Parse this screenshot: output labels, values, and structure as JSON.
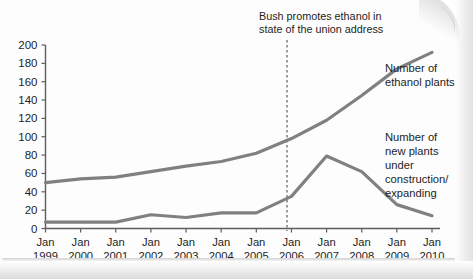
{
  "chart_data": {
    "type": "line",
    "title": "",
    "subtitle": "",
    "xlabel": "",
    "ylabel": "",
    "grid": false,
    "legend_position": "inline-right",
    "x": [
      "Jan 1999",
      "Jan 2000",
      "Jan 2001",
      "Jan 2002",
      "Jan 2003",
      "Jan 2004",
      "Jan 2005",
      "Jan 2006",
      "Jan 2007",
      "Jan 2008",
      "Jan 2009",
      "Jan 2010"
    ],
    "xtick_lines": [
      [
        "Jan",
        "1999"
      ],
      [
        "Jan",
        "2000"
      ],
      [
        "Jan",
        "2001"
      ],
      [
        "Jan",
        "2002"
      ],
      [
        "Jan",
        "2003"
      ],
      [
        "Jan",
        "2004"
      ],
      [
        "Jan",
        "2005"
      ],
      [
        "Jan",
        "2006"
      ],
      [
        "Jan",
        "2007"
      ],
      [
        "Jan",
        "2008"
      ],
      [
        "Jan",
        "2009"
      ],
      [
        "Jan",
        "2010"
      ]
    ],
    "ylim": [
      0,
      200
    ],
    "yticks": [
      0,
      20,
      40,
      60,
      80,
      100,
      120,
      140,
      160,
      180,
      200
    ],
    "series": [
      {
        "name": "Number of ethanol plants",
        "label_lines": [
          "Number of",
          "ethanol plants"
        ],
        "color": "#808080",
        "values": [
          50,
          54,
          56,
          62,
          68,
          73,
          82,
          98,
          118,
          145,
          174,
          192
        ]
      },
      {
        "name": "Number of new plants under construction/expanding",
        "label_lines": [
          "Number of",
          "new plants",
          "under",
          "construction/",
          "expanding"
        ],
        "color": "#808080",
        "values": [
          7,
          7,
          7,
          15,
          12,
          17,
          17,
          35,
          79,
          62,
          26,
          14
        ]
      }
    ],
    "annotations": [
      {
        "id": "bush-annotation",
        "text_lines": [
          "Bush promotes ethanol in",
          "state of the union address"
        ],
        "at_x": "Jan 2006",
        "marker": "dashed-vertical-line"
      }
    ]
  },
  "colors": {
    "line": "#808080",
    "axis": "#5d5d5d",
    "text": "#1e1e1e",
    "dashed": "#6b6b6b",
    "background": "#fdfdfd"
  }
}
